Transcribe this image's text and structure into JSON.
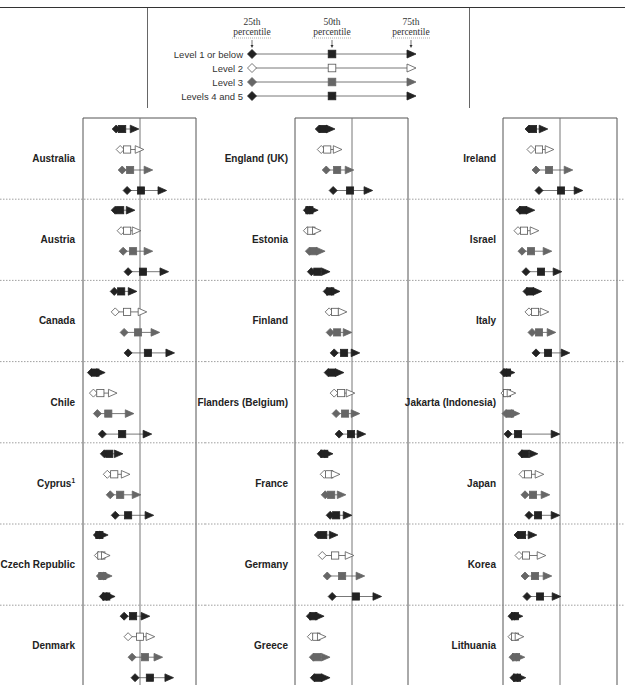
{
  "chart_data": {
    "type": "scatter",
    "subtype": "percentile-range dot plot",
    "title": "",
    "legend": {
      "placement": "top-center",
      "percentile_headers": [
        "25th percentile",
        "50th percentile",
        "75th percentile"
      ],
      "levels": [
        {
          "name": "Level 1 or below",
          "style": "filled-black"
        },
        {
          "name": "Level 2",
          "style": "hollow"
        },
        {
          "name": "Level 3",
          "style": "filled-grey"
        },
        {
          "name": "Levels 4 and 5",
          "style": "filled-black"
        }
      ]
    },
    "value_unit": "relative position to reference line (approx. points; reference = 0)",
    "xlim": [
      -57,
      57
    ],
    "reference_value": 0,
    "colors": {
      "level1": "#222222",
      "level2": "#ffffff",
      "level3": "#666666",
      "level45": "#222222",
      "line": "#555555"
    },
    "columns": [
      {
        "countries": [
          {
            "name": "Australia",
            "levels": [
              [
                -24,
                -18,
                -6
              ],
              [
                -20,
                -13,
                -1
              ],
              [
                -18,
                -10,
                8
              ],
              [
                -13,
                1,
                22
              ]
            ]
          },
          {
            "name": "Austria",
            "levels": [
              [
                -25,
                -20,
                -10
              ],
              [
                -19,
                -13,
                -4
              ],
              [
                -17,
                -7,
                8
              ],
              [
                -12,
                3,
                24
              ]
            ]
          },
          {
            "name": "Canada",
            "levels": [
              [
                -26,
                -19,
                -8
              ],
              [
                -25,
                -13,
                2
              ],
              [
                -16,
                -2,
                15
              ],
              [
                -12,
                8,
                30
              ]
            ]
          },
          {
            "name": "Chile",
            "levels": [
              [
                -49,
                -45,
                -40
              ],
              [
                -47,
                -40,
                -28
              ],
              [
                -43,
                -32,
                -11
              ],
              [
                -38,
                -18,
                7
              ]
            ]
          },
          {
            "name": "Cyprus",
            "superscript": "1",
            "levels": [
              [
                -36,
                -31,
                -22
              ],
              [
                -33,
                -26,
                -15
              ],
              [
                -30,
                -20,
                -4
              ],
              [
                -25,
                -12,
                9
              ]
            ]
          },
          {
            "name": "Czech Republic",
            "levels": [
              [
                -43,
                -41,
                -37
              ],
              [
                -42,
                -39,
                -35
              ],
              [
                -40,
                -38,
                -33
              ],
              [
                -37,
                -34,
                -30
              ]
            ]
          },
          {
            "name": "Denmark",
            "levels": [
              [
                -16,
                -7,
                5
              ],
              [
                -12,
                0,
                10
              ],
              [
                -8,
                5,
                18
              ],
              [
                -5,
                10,
                29
              ]
            ]
          }
        ]
      },
      {
        "countries": [
          {
            "name": "England (UK)",
            "levels": [
              [
                -33,
                -29,
                -22
              ],
              [
                -31,
                -25,
                -15
              ],
              [
                -26,
                -15,
                -3
              ],
              [
                -19,
                -2,
                16
              ]
            ]
          },
          {
            "name": "Estonia",
            "levels": [
              [
                -45,
                -43,
                -39
              ],
              [
                -45,
                -41,
                -36
              ],
              [
                -43,
                -39,
                -32
              ],
              [
                -41,
                -35,
                -27
              ]
            ]
          },
          {
            "name": "Finland",
            "levels": [
              [
                -25,
                -22,
                -17
              ],
              [
                -23,
                -17,
                -10
              ],
              [
                -22,
                -15,
                -5
              ],
              [
                -18,
                -8,
                3
              ]
            ]
          },
          {
            "name": "Flanders (Belgium)",
            "levels": [
              [
                -24,
                -20,
                -13
              ],
              [
                -18,
                -11,
                -2
              ],
              [
                -16,
                -7,
                3
              ],
              [
                -13,
                -1,
                9
              ]
            ]
          },
          {
            "name": "France",
            "levels": [
              [
                -31,
                -28,
                -24
              ],
              [
                -28,
                -23,
                -17
              ],
              [
                -27,
                -21,
                -11
              ],
              [
                -22,
                -16,
                -5
              ]
            ]
          },
          {
            "name": "Germany",
            "levels": [
              [
                -34,
                -29,
                -19
              ],
              [
                -30,
                -17,
                -3
              ],
              [
                -25,
                -10,
                8
              ],
              [
                -20,
                4,
                25
              ]
            ]
          },
          {
            "name": "Greece",
            "levels": [
              [
                -42,
                -39,
                -33
              ],
              [
                -41,
                -36,
                -31
              ],
              [
                -39,
                -35,
                -27
              ],
              [
                -38,
                -34,
                -27
              ]
            ]
          }
        ]
      },
      {
        "countries": [
          {
            "name": "Ireland",
            "levels": [
              [
                -31,
                -27,
                -17
              ],
              [
                -29,
                -21,
                -11
              ],
              [
                -24,
                -11,
                8
              ],
              [
                -21,
                1,
                18
              ]
            ]
          },
          {
            "name": "Israel",
            "levels": [
              [
                -40,
                -37,
                -30
              ],
              [
                -42,
                -36,
                -26
              ],
              [
                -38,
                -29,
                -13
              ],
              [
                -34,
                -19,
                -3
              ]
            ]
          },
          {
            "name": "Italy",
            "levels": [
              [
                -33,
                -30,
                -23
              ],
              [
                -31,
                -25,
                -16
              ],
              [
                -28,
                -21,
                -9
              ],
              [
                -24,
                -12,
                5
              ]
            ]
          },
          {
            "name": "Jakarta (Indonesia)",
            "levels": [
              [
                -56,
                -53,
                -50
              ],
              [
                -55,
                -53,
                -49
              ],
              [
                -54,
                -50,
                -45
              ],
              [
                -52,
                -42,
                -5
              ]
            ]
          },
          {
            "name": "Japan",
            "levels": [
              [
                -38,
                -35,
                -27
              ],
              [
                -37,
                -32,
                -21
              ],
              [
                -35,
                -27,
                -15
              ],
              [
                -31,
                -22,
                -5
              ]
            ]
          },
          {
            "name": "Korea",
            "levels": [
              [
                -42,
                -38,
                -28
              ],
              [
                -41,
                -34,
                -19
              ],
              [
                -35,
                -25,
                -13
              ],
              [
                -33,
                -20,
                -4
              ]
            ]
          },
          {
            "name": "Lithuania",
            "levels": [
              [
                -48,
                -45,
                -42
              ],
              [
                -48,
                -45,
                -41
              ],
              [
                -47,
                -44,
                -40
              ],
              [
                -46,
                -43,
                -39
              ]
            ]
          }
        ]
      }
    ]
  }
}
